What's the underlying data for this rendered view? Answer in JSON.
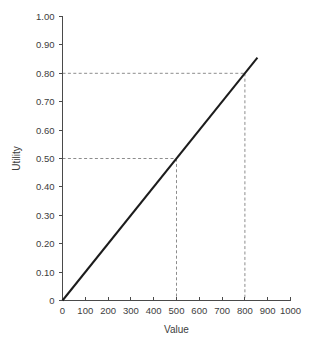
{
  "chart_data": {
    "type": "line",
    "title": "",
    "subtitle": "",
    "xlabel": "Value",
    "ylabel": "Utility",
    "xlim": [
      0,
      1000
    ],
    "ylim": [
      0,
      1.0
    ],
    "grid": false,
    "legend": null,
    "x_ticks": [
      0,
      100,
      200,
      300,
      400,
      500,
      600,
      700,
      800,
      900,
      1000
    ],
    "x_tick_labels": [
      "0",
      "100",
      "200",
      "300",
      "400",
      "500",
      "600",
      "700",
      "800",
      "900",
      "1000"
    ],
    "y_ticks": [
      0,
      0.1,
      0.2,
      0.3,
      0.4,
      0.5,
      0.6,
      0.7,
      0.8,
      0.9,
      1.0
    ],
    "y_tick_labels": [
      "0",
      "0.10",
      "0.20",
      "0.30",
      "0.40",
      "0.50",
      "0.60",
      "0.70",
      "0.80",
      "0.90",
      "1.00"
    ],
    "series": [
      {
        "name": "Utility function",
        "color": "#1c1c1c",
        "style": "solid",
        "x": [
          0,
          855
        ],
        "y": [
          0,
          0.855
        ]
      }
    ],
    "annotations": [
      {
        "kind": "reference-guide",
        "style": "dashed",
        "color": "#8c8c8c",
        "x": 500,
        "y": 0.5,
        "label": "Value 500 maps to utility 0.50"
      },
      {
        "kind": "reference-guide",
        "style": "dashed",
        "color": "#8c8c8c",
        "x": 800,
        "y": 0.8,
        "label": "Value 800 maps to utility 0.80"
      }
    ]
  }
}
